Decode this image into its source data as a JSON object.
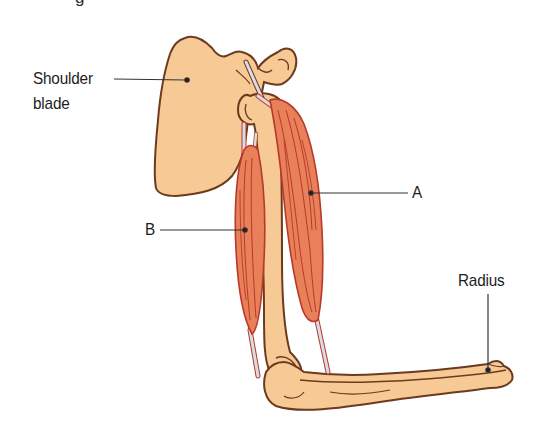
{
  "diagram": {
    "top_text_cropped": "g",
    "labels": {
      "shoulder_blade": [
        "Shoulder",
        "blade"
      ],
      "muscle_a": "A",
      "muscle_b": "B",
      "radius": "Radius"
    },
    "colors": {
      "bone_fill": "#F6C995",
      "bone_outline": "#6B3A1F",
      "muscle_fill": "#E8805A",
      "muscle_line": "#B8392A",
      "tendon": "#D8DCE4",
      "leader_line": "#333333",
      "label_text": "#1d1d1b"
    }
  }
}
